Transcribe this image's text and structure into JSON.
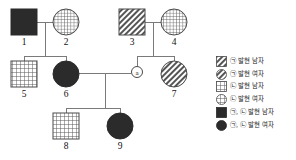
{
  "diagram": {
    "kind": "pedigree-chart",
    "generations": 3,
    "individuals": [
      {
        "id": "1",
        "label": "1",
        "sex": "male",
        "shape": "square",
        "fill": "solid-black",
        "x": 24,
        "y": 22,
        "size": 26
      },
      {
        "id": "2",
        "label": "2",
        "sex": "female",
        "shape": "circle",
        "fill": "grid",
        "x": 66,
        "y": 22,
        "size": 26
      },
      {
        "id": "3",
        "label": "3",
        "sex": "male",
        "shape": "square",
        "fill": "diagonal-hatch",
        "x": 132,
        "y": 22,
        "size": 26
      },
      {
        "id": "4",
        "label": "4",
        "sex": "female",
        "shape": "circle",
        "fill": "grid",
        "x": 174,
        "y": 22,
        "size": 26
      },
      {
        "id": "5",
        "label": "5",
        "sex": "male",
        "shape": "square",
        "fill": "grid",
        "x": 24,
        "y": 74,
        "size": 26
      },
      {
        "id": "6",
        "label": "6",
        "sex": "female",
        "shape": "circle",
        "fill": "solid-black",
        "x": 66,
        "y": 74,
        "size": 26
      },
      {
        "id": "7",
        "label": "7",
        "sex": "female",
        "shape": "circle",
        "fill": "diagonal-hatch",
        "x": 174,
        "y": 74,
        "size": 26
      },
      {
        "id": "8",
        "label": "8",
        "sex": "male",
        "shape": "square",
        "fill": "grid",
        "x": 66,
        "y": 126,
        "size": 26
      },
      {
        "id": "9",
        "label": "9",
        "sex": "female",
        "shape": "circle",
        "fill": "solid-black",
        "x": 120,
        "y": 126,
        "size": 26
      }
    ],
    "anonymous_node": {
      "id": "a",
      "label": "a",
      "shape": "small-circle",
      "x": 137,
      "y": 72,
      "size": 11
    },
    "unions": [
      {
        "partners": [
          "1",
          "2"
        ],
        "children": [
          "5",
          "6"
        ]
      },
      {
        "partners": [
          "3",
          "4"
        ],
        "children": [
          "a",
          "7"
        ]
      },
      {
        "partners": [
          "6",
          "a"
        ],
        "children": [
          "8",
          "9"
        ]
      }
    ],
    "line_color": "#6b6b6b",
    "symbol_stroke": "#3a3a3a",
    "solid_fill": "#2b2b2b"
  },
  "legend": {
    "entries": [
      {
        "key": "hatch-square",
        "swatch": "diagonal-hatch-square",
        "text": "㉠ 발현 남자"
      },
      {
        "key": "hatch-circle",
        "swatch": "diagonal-hatch-circle",
        "text": "㉠ 발현 여자"
      },
      {
        "key": "grid-square",
        "swatch": "grid-square",
        "text": "㉡ 발현 남자"
      },
      {
        "key": "grid-circle",
        "swatch": "grid-circle",
        "text": "㉡ 발현 여자"
      },
      {
        "key": "solid-square",
        "swatch": "solid-square",
        "text": "㉠, ㉡ 발현 남자"
      },
      {
        "key": "solid-circle",
        "swatch": "solid-circle",
        "text": "㉠, ㉡ 발현 여자"
      }
    ]
  }
}
